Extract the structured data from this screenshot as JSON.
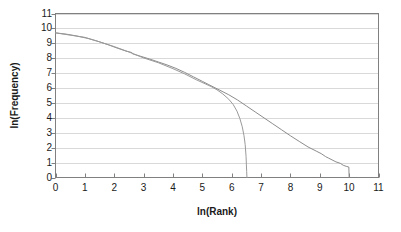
{
  "chart_data": {
    "type": "line",
    "title": "",
    "subtitle": "",
    "xlabel": "ln(Rank)",
    "ylabel": "ln(Frequency)",
    "xlim": [
      0,
      11
    ],
    "ylim": [
      0,
      11
    ],
    "xticks": [
      0,
      1,
      2,
      3,
      4,
      5,
      6,
      7,
      8,
      9,
      10,
      11
    ],
    "yticks": [
      0,
      1,
      2,
      3,
      4,
      5,
      6,
      7,
      8,
      9,
      10,
      11
    ],
    "grid": "horizontal",
    "legend": "none",
    "annotations": [],
    "series": [
      {
        "name": "empirical",
        "color": "#8c8c8c",
        "x": [
          0.0,
          0.35,
          0.7,
          1.1,
          1.45,
          1.8,
          2.1,
          2.4,
          2.6,
          2.62,
          2.9,
          3.2,
          3.5,
          3.8,
          4.1,
          4.4,
          4.7,
          5.0,
          5.2,
          5.4,
          5.6,
          5.9,
          6.2,
          6.5,
          6.8,
          7.1,
          7.4,
          7.7,
          8.0,
          8.3,
          8.6,
          8.9,
          9.05,
          9.2,
          9.3,
          9.45,
          9.55,
          9.7,
          9.8,
          9.9,
          9.99,
          10.0
        ],
        "y": [
          9.7,
          9.62,
          9.5,
          9.33,
          9.13,
          8.9,
          8.68,
          8.48,
          8.38,
          8.3,
          8.13,
          7.95,
          7.75,
          7.55,
          7.32,
          7.05,
          6.75,
          6.45,
          6.25,
          6.05,
          5.85,
          5.55,
          5.2,
          4.8,
          4.4,
          4.0,
          3.6,
          3.2,
          2.8,
          2.42,
          2.05,
          1.75,
          1.6,
          1.4,
          1.3,
          1.15,
          1.05,
          0.95,
          0.82,
          0.75,
          0.7,
          0.0
        ]
      },
      {
        "name": "fitted",
        "color": "#9a9a9a",
        "x": [
          0.0,
          0.5,
          1.0,
          1.5,
          2.0,
          2.5,
          3.0,
          3.5,
          4.0,
          4.4,
          4.8,
          5.1,
          5.3,
          5.5,
          5.7,
          5.9,
          6.05,
          6.18,
          6.28,
          6.36,
          6.42,
          6.46,
          6.49,
          6.5,
          6.51,
          6.52
        ],
        "y": [
          9.7,
          9.55,
          9.4,
          9.1,
          8.78,
          8.42,
          8.02,
          7.7,
          7.3,
          6.95,
          6.55,
          6.28,
          6.1,
          5.88,
          5.6,
          5.25,
          4.9,
          4.45,
          3.95,
          3.4,
          2.8,
          2.2,
          1.4,
          0.9,
          0.4,
          0.0
        ]
      }
    ]
  },
  "axes": {
    "frame_color": "#808080",
    "grid_color": "#d9d9d9",
    "tick_color": "#808080",
    "text_color": "#1a1a1a",
    "background": "#ffffff"
  },
  "tick_labels": {
    "x": [
      "0",
      "1",
      "2",
      "3",
      "4",
      "5",
      "6",
      "7",
      "8",
      "9",
      "10",
      "11"
    ],
    "y": [
      "0",
      "1",
      "2",
      "3",
      "4",
      "5",
      "6",
      "7",
      "8",
      "9",
      "10",
      "11"
    ]
  }
}
